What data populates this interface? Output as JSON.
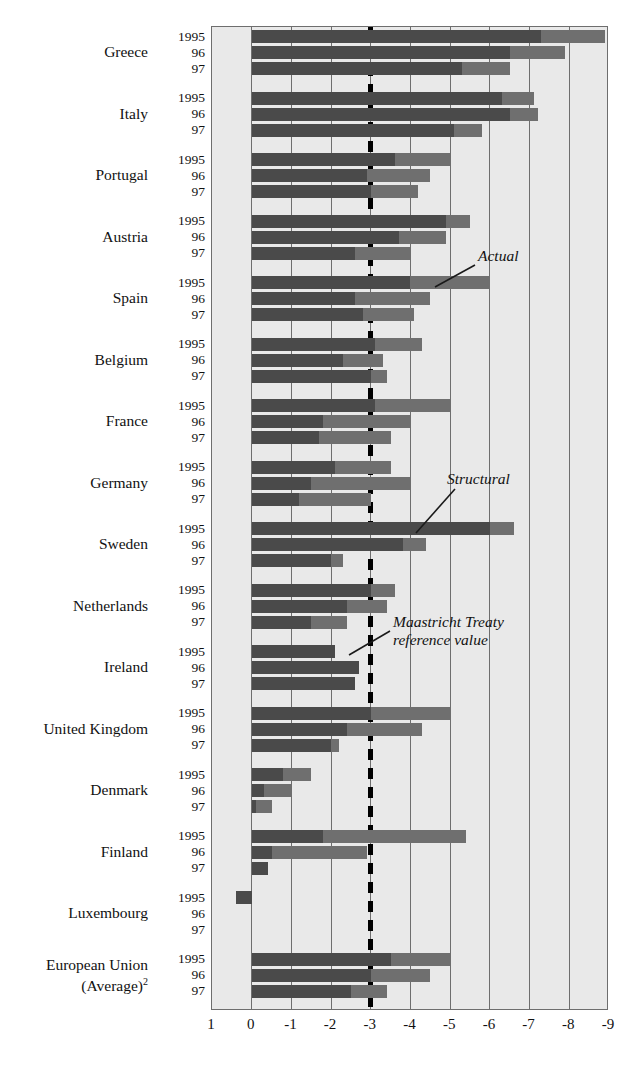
{
  "chart_data": {
    "type": "bar",
    "orientation": "horizontal",
    "title": "",
    "xlabel": "",
    "ylabel": "",
    "xlim": [
      1,
      -9
    ],
    "xticks": [
      "1",
      "0",
      "-1",
      "-2",
      "-3",
      "-4",
      "-5",
      "-6",
      "-7",
      "-8",
      "-9"
    ],
    "grid": true,
    "legend_position": "inline-annotation",
    "series": [
      {
        "name": "Actual",
        "color": "#6f6f6f"
      },
      {
        "name": "Structural",
        "color": "#4a4a4a"
      }
    ],
    "reference_line": {
      "label": "Maastricht Treaty reference value",
      "value": -3,
      "style": "dashed"
    },
    "years": [
      "1995",
      "96",
      "97"
    ],
    "groups": [
      {
        "country": "Greece",
        "rows": [
          {
            "year": "1995",
            "actual": -8.9,
            "structural": -7.3
          },
          {
            "year": "96",
            "actual": -7.9,
            "structural": -6.5
          },
          {
            "year": "97",
            "actual": -6.5,
            "structural": -5.3
          }
        ]
      },
      {
        "country": "Italy",
        "rows": [
          {
            "year": "1995",
            "actual": -7.1,
            "structural": -6.3
          },
          {
            "year": "96",
            "actual": -7.2,
            "structural": -6.5
          },
          {
            "year": "97",
            "actual": -5.8,
            "structural": -5.1
          }
        ]
      },
      {
        "country": "Portugal",
        "rows": [
          {
            "year": "1995",
            "actual": -5.0,
            "structural": -3.6
          },
          {
            "year": "96",
            "actual": -4.5,
            "structural": -2.9
          },
          {
            "year": "97",
            "actual": -4.2,
            "structural": -3.0
          }
        ]
      },
      {
        "country": "Austria",
        "rows": [
          {
            "year": "1995",
            "actual": -5.5,
            "structural": -4.9
          },
          {
            "year": "96",
            "actual": -4.9,
            "structural": -3.7
          },
          {
            "year": "97",
            "actual": -4.0,
            "structural": -2.6
          }
        ]
      },
      {
        "country": "Spain",
        "rows": [
          {
            "year": "1995",
            "actual": -6.0,
            "structural": -4.0
          },
          {
            "year": "96",
            "actual": -4.5,
            "structural": -2.6
          },
          {
            "year": "97",
            "actual": -4.1,
            "structural": -2.8
          }
        ]
      },
      {
        "country": "Belgium",
        "rows": [
          {
            "year": "1995",
            "actual": -4.3,
            "structural": -3.1
          },
          {
            "year": "96",
            "actual": -3.3,
            "structural": -2.3
          },
          {
            "year": "97",
            "actual": -3.4,
            "structural": -3.0
          }
        ]
      },
      {
        "country": "France",
        "rows": [
          {
            "year": "1995",
            "actual": -5.0,
            "structural": -3.1
          },
          {
            "year": "96",
            "actual": -4.0,
            "structural": -1.8
          },
          {
            "year": "97",
            "actual": -3.5,
            "structural": -1.7
          }
        ]
      },
      {
        "country": "Germany",
        "rows": [
          {
            "year": "1995",
            "actual": -3.5,
            "structural": -2.1
          },
          {
            "year": "96",
            "actual": -4.0,
            "structural": -1.5
          },
          {
            "year": "97",
            "actual": -3.0,
            "structural": -1.2
          }
        ]
      },
      {
        "country": "Sweden",
        "rows": [
          {
            "year": "1995",
            "actual": -6.6,
            "structural": -6.0
          },
          {
            "year": "96",
            "actual": -4.4,
            "structural": -3.8
          },
          {
            "year": "97",
            "actual": -2.3,
            "structural": -2.0
          }
        ]
      },
      {
        "country": "Netherlands",
        "rows": [
          {
            "year": "1995",
            "actual": -3.6,
            "structural": -3.0
          },
          {
            "year": "96",
            "actual": -3.4,
            "structural": -2.4
          },
          {
            "year": "97",
            "actual": -2.4,
            "structural": -1.5
          }
        ]
      },
      {
        "country": "Ireland",
        "rows": [
          {
            "year": "1995",
            "actual": -2.1,
            "structural": -2.1
          },
          {
            "year": "96",
            "actual": -2.7,
            "structural": -2.7
          },
          {
            "year": "97",
            "actual": -2.6,
            "structural": -2.6
          }
        ]
      },
      {
        "country": "United Kingdom",
        "rows": [
          {
            "year": "1995",
            "actual": -5.0,
            "structural": -3.0
          },
          {
            "year": "96",
            "actual": -4.3,
            "structural": -2.4
          },
          {
            "year": "97",
            "actual": -2.2,
            "structural": -2.0
          }
        ]
      },
      {
        "country": "Denmark",
        "rows": [
          {
            "year": "1995",
            "actual": -1.5,
            "structural": -0.8
          },
          {
            "year": "96",
            "actual": -1.0,
            "structural": -0.3
          },
          {
            "year": "97",
            "actual": -0.5,
            "structural": -0.1
          }
        ]
      },
      {
        "country": "Finland",
        "rows": [
          {
            "year": "1995",
            "actual": -5.4,
            "structural": -1.8
          },
          {
            "year": "96",
            "actual": -2.9,
            "structural": -0.5
          },
          {
            "year": "97",
            "actual": -0.4,
            "structural": -0.4
          }
        ]
      },
      {
        "country": "Luxembourg",
        "rows": [
          {
            "year": "1995",
            "actual": 0.4,
            "structural": 0.4
          },
          {
            "year": "96",
            "actual": 0,
            "structural": 0
          },
          {
            "year": "97",
            "actual": 0,
            "structural": 0
          }
        ]
      },
      {
        "country": "European Union (Average)",
        "country_sup": "2",
        "rows": [
          {
            "year": "1995",
            "actual": -5.0,
            "structural": -3.5
          },
          {
            "year": "96",
            "actual": -4.5,
            "structural": -3.0
          },
          {
            "year": "97",
            "actual": -3.4,
            "structural": -2.5
          }
        ]
      }
    ],
    "annotations": [
      {
        "id": "actual",
        "text": "Actual",
        "x_px": 478,
        "y_px": 247
      },
      {
        "id": "structural",
        "text": "Structural",
        "x_px": 447,
        "y_px": 470
      },
      {
        "id": "maastricht1",
        "text": "Maastricht Treaty",
        "x_px": 393,
        "y_px": 613
      },
      {
        "id": "maastricht2",
        "text": "reference value",
        "x_px": 393,
        "y_px": 631
      }
    ]
  }
}
